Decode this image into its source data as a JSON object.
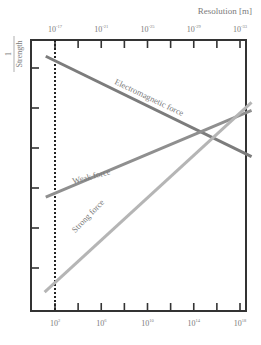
{
  "chart_data": {
    "type": "line",
    "title": "",
    "top_axis_label": "Resolution [m]",
    "xlabel": "",
    "ylabel_numerator": "1",
    "ylabel_denominator": "Strength",
    "bottom_axis": {
      "scale": "log",
      "tick_labels": [
        {
          "base": "10",
          "exp": "2"
        },
        {
          "base": "10",
          "exp": "6"
        },
        {
          "base": "10",
          "exp": "10"
        },
        {
          "base": "10",
          "exp": "14"
        },
        {
          "base": "10",
          "exp": "18"
        }
      ],
      "range": [
        1,
        19
      ]
    },
    "top_axis": {
      "scale": "log",
      "tick_labels": [
        {
          "base": "10",
          "exp": "-17"
        },
        {
          "base": "10",
          "exp": "-21"
        },
        {
          "base": "10",
          "exp": "-25"
        },
        {
          "base": "10",
          "exp": "-29"
        },
        {
          "base": "10",
          "exp": "-33"
        }
      ]
    },
    "y_axis": {
      "ticks": 6,
      "tick_labels": [],
      "range": [
        0,
        1
      ]
    },
    "reference_line": {
      "style": "dotted",
      "x_exp": 2
    },
    "series": [
      {
        "name": "Electromagnetic force",
        "color": "#7c7c7c",
        "x_exp": [
          1.2,
          19
        ],
        "y": [
          0.94,
          0.57
        ]
      },
      {
        "name": "Weak force",
        "color": "#8f8f8f",
        "x_exp": [
          1.2,
          19
        ],
        "y": [
          0.42,
          0.74
        ]
      },
      {
        "name": "Strong force",
        "color": "#b5b5b5",
        "x_exp": [
          1.1,
          19
        ],
        "y": [
          0.07,
          0.77
        ]
      }
    ],
    "grid": false,
    "legend": "inline labels on lines"
  },
  "colors": {
    "frame": "#333333",
    "text": "#7a7a7a"
  }
}
